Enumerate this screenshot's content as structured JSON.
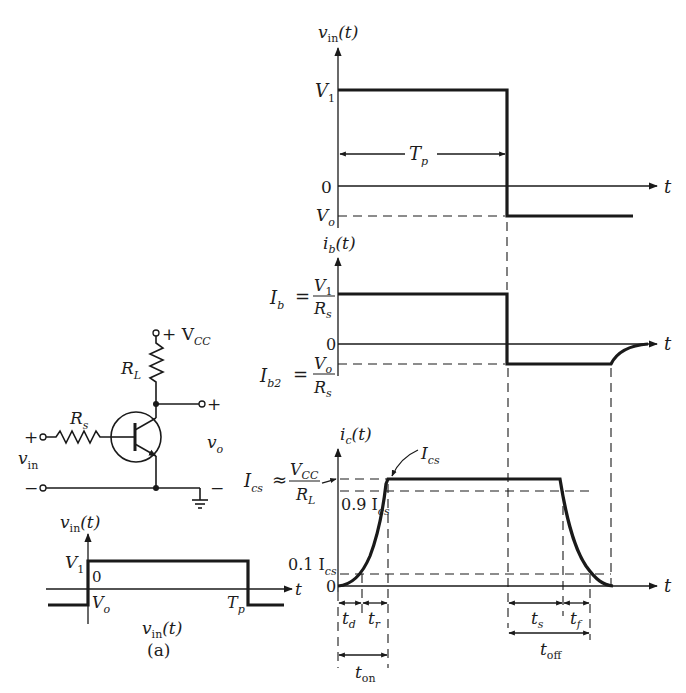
{
  "figure": {
    "caption": "(a)",
    "circuit": {
      "supply_label": "+ V",
      "supply_sub": "CC",
      "load_resistor_label": "R",
      "load_resistor_sub": "L",
      "source_resistor_label": "R",
      "source_resistor_sub": "s",
      "input_plus": "+",
      "input_minus": "−",
      "input_label": "v",
      "input_sub": "in",
      "output_plus": "+",
      "output_minus": "−",
      "output_label": "v",
      "output_sub": "o"
    },
    "small_input_plot": {
      "ylabel": "v",
      "ylabel_sub": "in",
      "ylabel_tail": "(t)",
      "v1_label": "V",
      "v1_sub": "1",
      "zero_label": "0",
      "vo_label": "V",
      "vo_sub": "o",
      "tp_label": "T",
      "tp_sub": "p",
      "t_label": "t",
      "bottom_label": "v",
      "bottom_sub": "in",
      "bottom_tail": "(t)"
    },
    "vin_plot": {
      "ylabel": "v",
      "ylabel_sub": "in",
      "ylabel_tail": "(t)",
      "v1_label": "V",
      "v1_sub": "1",
      "tp_label": "T",
      "tp_sub": "p",
      "zero_label": "0",
      "vo_label": "V",
      "vo_sub": "o",
      "t_label": "t"
    },
    "ib_plot": {
      "ylabel": "i",
      "ylabel_sub": "b",
      "ylabel_tail": "(t)",
      "ib_label": "I",
      "ib_sub": "b",
      "ib_eq": "=",
      "ib_num": "V",
      "ib_num_sub": "1",
      "ib_den": "R",
      "ib_den_sub": "s",
      "zero_label": "0",
      "ib2_label": "I",
      "ib2_sub": "b2",
      "ib2_eq": "=",
      "ib2_num": "V",
      "ib2_num_sub": "o",
      "ib2_den": "R",
      "ib2_den_sub": "s",
      "t_label": "t"
    },
    "ic_plot": {
      "ylabel": "i",
      "ylabel_sub": "c",
      "ylabel_tail": "(t)",
      "ics_label": "I",
      "ics_sub": "cs",
      "ics_eq": "≈",
      "ics_num": "V",
      "ics_num_sub": "CC",
      "ics_den": "R",
      "ics_den_sub": "L",
      "ics_callout": "I",
      "ics_callout_sub": "cs",
      "p90_label": "0.9 I",
      "p90_sub": "cs",
      "p10_label": "0.1 I",
      "p10_sub": "cs",
      "zero_label": "0",
      "t_label": "t"
    },
    "timing": {
      "td": "t",
      "td_sub": "d",
      "tr": "t",
      "tr_sub": "r",
      "ton": "t",
      "ton_sub": "on",
      "ts": "t",
      "ts_sub": "s",
      "tf": "t",
      "tf_sub": "f",
      "toff": "t",
      "toff_sub": "off"
    }
  }
}
